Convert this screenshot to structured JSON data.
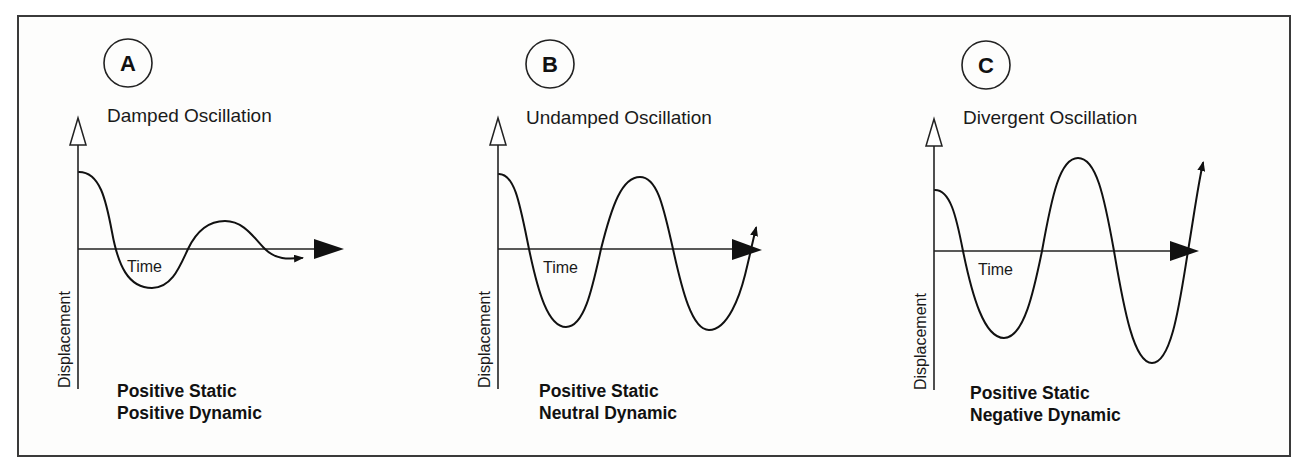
{
  "figure": {
    "panels": [
      {
        "id": "A",
        "letter": "A",
        "title": "Damped Oscillation",
        "x_axis_label": "Time",
        "y_axis_label": "Displacement",
        "caption_line1": "Positive Static",
        "caption_line2": "Positive Dynamic"
      },
      {
        "id": "B",
        "letter": "B",
        "title": "Undamped Oscillation",
        "x_axis_label": "Time",
        "y_axis_label": "Displacement",
        "caption_line1": "Positive Static",
        "caption_line2": "Neutral Dynamic"
      },
      {
        "id": "C",
        "letter": "C",
        "title": "Divergent Oscillation",
        "x_axis_label": "Time",
        "y_axis_label": "Displacement",
        "caption_line1": "Positive Static",
        "caption_line2": "Negative Dynamic"
      }
    ],
    "colors": {
      "ink": "#111111",
      "frame": "#3a3a3a",
      "background": "#fdfdfc"
    }
  }
}
